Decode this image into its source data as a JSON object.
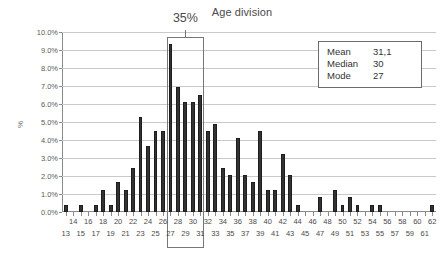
{
  "chart_data": {
    "type": "bar",
    "title": "Age division",
    "xlabel": "",
    "ylabel": "%",
    "ylim": [
      0,
      10
    ],
    "ytick_labels": [
      "0.0%",
      "1.0%",
      "2.0%",
      "3.0%",
      "4.0%",
      "5.0%",
      "6.0%",
      "7.0%",
      "8.0%",
      "9.0%",
      "10.0%"
    ],
    "ytick_values": [
      0,
      1,
      2,
      3,
      4,
      5,
      6,
      7,
      8,
      9,
      10
    ],
    "grid": true,
    "legend": false,
    "categories": [
      13,
      14,
      15,
      16,
      17,
      18,
      19,
      20,
      21,
      22,
      23,
      24,
      25,
      26,
      27,
      28,
      29,
      30,
      31,
      32,
      33,
      34,
      35,
      36,
      37,
      38,
      39,
      40,
      41,
      42,
      43,
      44,
      45,
      46,
      47,
      48,
      49,
      50,
      51,
      52,
      53,
      54,
      55,
      56,
      57,
      58,
      59,
      60,
      61,
      62
    ],
    "values": [
      0.4,
      0.0,
      0.4,
      0.0,
      0.4,
      1.2,
      0.4,
      1.65,
      1.25,
      2.45,
      5.3,
      3.65,
      4.5,
      4.5,
      9.35,
      6.95,
      6.1,
      6.1,
      6.5,
      4.5,
      4.9,
      2.45,
      2.05,
      4.1,
      2.05,
      1.65,
      4.5,
      1.25,
      1.25,
      3.25,
      2.05,
      0.4,
      0.0,
      0.0,
      0.85,
      0.0,
      1.25,
      0.4,
      0.85,
      0.4,
      0.0,
      0.4,
      0.4,
      0.0,
      0.0,
      0.0,
      0.0,
      0.0,
      0.0,
      0.4
    ],
    "annotations": [
      {
        "name": "bracket-35-percent",
        "label": "35%",
        "span_from": 27,
        "span_to": 31,
        "note": "bracket spanning ages 27 through 31 summing to 35%"
      }
    ]
  },
  "stats_box": {
    "rows": [
      {
        "key": "Mean",
        "value": "31,1"
      },
      {
        "key": "Median",
        "value": "30"
      },
      {
        "key": "Mode",
        "value": "27"
      }
    ]
  },
  "colors": {
    "bar": "#333333",
    "grid": "#c9c9c9",
    "axis": "#8a8a8a",
    "text": "#3a3a3a",
    "box_border": "#6b6b6b"
  }
}
